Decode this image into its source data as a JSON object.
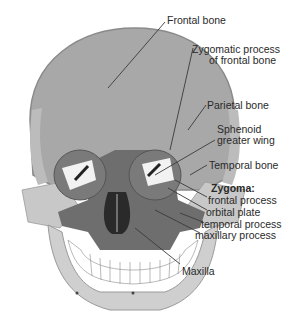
{
  "diagram": {
    "colors": {
      "frontal_bone": "#a8a8a8",
      "skull_outline": "#8a8a8a",
      "parietal": "#bcbcbc",
      "maxilla": "#6e6e6e",
      "zygoma": "#c8c8c8",
      "mandible": "#cfcfcf",
      "teeth": "#ffffff",
      "orbit": "#7a7a7a",
      "leader_line": "#3a3a3a",
      "text": "#2a2a2a"
    },
    "labels": {
      "frontal_bone": "Frontal bone",
      "zygomatic_process_line1": "Zygomatic process",
      "zygomatic_process_line2": "of frontal bone",
      "parietal_bone": "Parietal bone",
      "sphenoid_line1": "Sphenoid",
      "sphenoid_line2": "greater wing",
      "temporal_bone": "Temporal bone",
      "zygoma_heading": "Zygoma:",
      "zygoma_frontal": "frontal process",
      "zygoma_orbital": "orbital plate",
      "zygoma_temporal": "temporal process",
      "zygoma_maxillary": "maxillary process",
      "maxilla": "Maxilla"
    }
  }
}
